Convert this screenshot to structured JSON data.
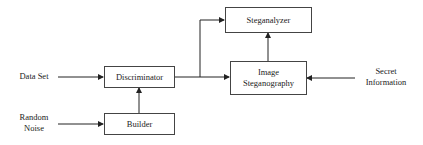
{
  "diagram": {
    "nodes": {
      "discriminator": "Discriminator",
      "builder": "Builder",
      "steganalyzer": "Steganalyzer",
      "image_steganography": [
        "Image",
        "Steganography"
      ]
    },
    "inputs": {
      "data_set": "Data Set",
      "random_noise": [
        "Random",
        "Noise"
      ],
      "secret_information": [
        "Secret",
        "Information"
      ]
    },
    "edges": [
      {
        "from": "Data Set",
        "to": "Discriminator"
      },
      {
        "from": "Random Noise",
        "to": "Builder"
      },
      {
        "from": "Builder",
        "to": "Discriminator"
      },
      {
        "from": "Discriminator",
        "to": "Steganalyzer"
      },
      {
        "from": "Discriminator",
        "to": "Image Steganography"
      },
      {
        "from": "Image Steganography",
        "to": "Steganalyzer"
      },
      {
        "from": "Secret Information",
        "to": "Image Steganography"
      }
    ],
    "colors": {
      "line": "#222222",
      "box_border": "#444444",
      "background": "#ffffff"
    }
  }
}
